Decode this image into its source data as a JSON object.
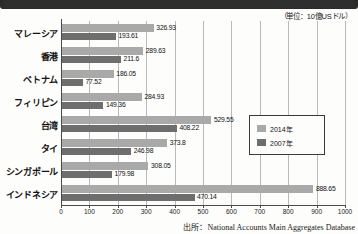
{
  "unit_note": "（単位：10億USドル）",
  "source_note": "出所：National Accounts Main Aggregates Database",
  "legend": {
    "items": [
      {
        "label": "2014年",
        "color": "#a9a9a9",
        "key": "y2014"
      },
      {
        "label": "2007年",
        "color": "#6e6e6e",
        "key": "y2007"
      }
    ]
  },
  "chart_data": {
    "type": "bar",
    "orientation": "horizontal",
    "title": "",
    "xlabel": "",
    "ylabel": "",
    "xlim": [
      0,
      1000
    ],
    "xticks": [
      0,
      100,
      200,
      300,
      400,
      500,
      600,
      700,
      800,
      900,
      1000
    ],
    "xtick_labels": [
      "0",
      "100",
      "200",
      "300",
      "400",
      "500",
      "600",
      "700",
      "800",
      "900",
      "1000"
    ],
    "grid": true,
    "grid_axis": "x",
    "legend_position": "center-right",
    "unit": "10億USドル",
    "categories": [
      "マレーシア",
      "香港",
      "ベトナム",
      "フィリピン",
      "台湾",
      "タイ",
      "シンガポール",
      "インドネシア"
    ],
    "series": [
      {
        "name": "2014年",
        "color": "#a9a9a9",
        "values": [
          326.93,
          289.63,
          186.05,
          284.93,
          529.55,
          373.8,
          308.05,
          888.65
        ],
        "labels": [
          "326.93",
          "289.63",
          "186.05",
          "284.93",
          "529.55",
          "373.8",
          "308.05",
          "888.65"
        ]
      },
      {
        "name": "2007年",
        "color": "#6e6e6e",
        "values": [
          193.61,
          211.6,
          77.52,
          149.36,
          408.22,
          246.98,
          179.98,
          470.14
        ],
        "labels": [
          "193.61",
          "211.6",
          "77.52",
          "149.36",
          "408.22",
          "246.98",
          "179.98",
          "470.14"
        ]
      }
    ]
  }
}
